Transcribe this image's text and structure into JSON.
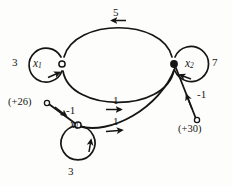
{
  "figure": {
    "type": "signal-flow-graph",
    "background_color": "#fdfdfb",
    "stroke_color": "#151515",
    "node_fill_open": "#ffffff",
    "node_fill_solid": "#151515",
    "nodes": [
      {
        "id": "n1",
        "label": "x",
        "subscript": "1",
        "x": 62,
        "y": 64,
        "style": "open",
        "self_loop_gain": "3",
        "self_loop_side": "left"
      },
      {
        "id": "n2",
        "label": "x",
        "subscript": "2",
        "x": 174,
        "y": 64,
        "style": "solid",
        "self_loop_gain": "7",
        "self_loop_side": "right"
      },
      {
        "id": "n3",
        "label": "x",
        "subscript": "1",
        "x": 78,
        "y": 125,
        "style": "open",
        "self_loop_gain": "3",
        "self_loop_side": "bottom"
      }
    ],
    "sources": [
      {
        "id": "s1",
        "label": "(+26)",
        "x": 47,
        "y": 103,
        "gain": "-1",
        "target": "n3"
      },
      {
        "id": "s2",
        "label": "(+30)",
        "x": 197,
        "y": 120,
        "gain": "-1",
        "target": "n2"
      }
    ],
    "edges": [
      {
        "from": "n2",
        "to": "n1",
        "gain": "5",
        "path": "top-arc",
        "direction": "right-to-left"
      },
      {
        "from": "n1",
        "to": "n2",
        "gain": "1",
        "path": "middle-arc",
        "direction": "left-to-right"
      },
      {
        "from": "n3",
        "to": "n2",
        "gain": "1",
        "path": "lower-arc",
        "direction": "left-to-right"
      }
    ],
    "labels": {
      "gain_top": "5",
      "gain_middle": "1",
      "gain_lower": "1",
      "gain_left_loop": "3",
      "gain_right_loop": "7",
      "gain_bottom_loop": "3",
      "gain_source_left": "-1",
      "gain_source_right": "-1",
      "source_left_value": "(+26)",
      "source_right_value": "(+30)",
      "node_left_name": "x",
      "node_left_sub": "1",
      "node_right_name": "x",
      "node_right_sub": "2",
      "node_bottom_name": "x",
      "node_bottom_sub": "1"
    }
  }
}
